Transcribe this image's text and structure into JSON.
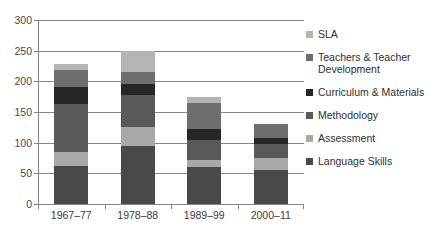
{
  "chart_data": {
    "type": "bar",
    "subtype": "stacked-bar",
    "title": "",
    "xlabel": "",
    "ylabel": "",
    "ylim": [
      0,
      300
    ],
    "ytick_step": 50,
    "yticks": [
      0,
      50,
      100,
      150,
      200,
      250,
      300
    ],
    "grid": true,
    "legend_position": "right",
    "categories": [
      "1967–77",
      "1978–88",
      "1989–99",
      "2000–11"
    ],
    "series": [
      {
        "name": "Language Skills",
        "values": [
          62,
          95,
          60,
          55
        ],
        "color": "#494949"
      },
      {
        "name": "Assessment",
        "values": [
          23,
          30,
          12,
          20
        ],
        "color": "#a8a8a8"
      },
      {
        "name": "Methodology",
        "values": [
          78,
          53,
          33,
          23
        ],
        "color": "#595959"
      },
      {
        "name": "Curriculum & Materials",
        "values": [
          27,
          18,
          17,
          10
        ],
        "color": "#262626"
      },
      {
        "name": "Teachers & Teacher Development",
        "values": [
          28,
          20,
          43,
          22
        ],
        "color": "#6e6e6e"
      },
      {
        "name": "SLA",
        "values": [
          10,
          34,
          10,
          0
        ],
        "color": "#b4b4b4"
      }
    ],
    "totals": [
      228,
      250,
      175,
      130
    ],
    "stack_order_bottom_to_top": [
      "Language Skills",
      "Assessment",
      "Methodology",
      "Curriculum & Materials",
      "Teachers & Teacher Development",
      "SLA"
    ]
  },
  "legend": {
    "entries": [
      {
        "label": "SLA",
        "color": "#b4b4b4"
      },
      {
        "label": "Teachers & Teacher Development",
        "color": "#6e6e6e"
      },
      {
        "label": "Curriculum & Materials",
        "color": "#262626"
      },
      {
        "label": "Methodology",
        "color": "#595959"
      },
      {
        "label": "Assessment",
        "color": "#a8a8a8"
      },
      {
        "label": "Language Skills",
        "color": "#494949"
      }
    ]
  },
  "axes": {
    "y_tick_labels": [
      "300",
      "250",
      "200",
      "150",
      "100",
      "50",
      "0"
    ],
    "x_tick_labels": [
      "1967–77",
      "1978–88",
      "1989–99",
      "2000–11"
    ],
    "axis_color": "#868686",
    "label_color": "#4a4a4a"
  }
}
